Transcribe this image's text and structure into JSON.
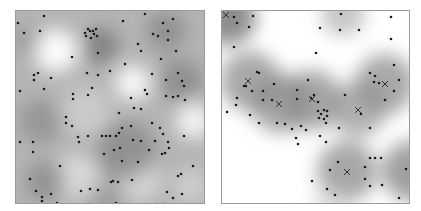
{
  "chart_data": [
    {
      "type": "scatter",
      "title": "",
      "description": "Point pattern over estimated intensity surface (grayscale, darker = higher intensity)",
      "xlabel": "",
      "ylabel": "",
      "grid": false,
      "legend": null,
      "panel": {
        "x": 15,
        "y": 10,
        "width": 188,
        "height": 192
      },
      "background_gray": "#b4b4b4",
      "intensity_blobs": [
        {
          "x": 40,
          "y": 40,
          "r": 22,
          "color": "#ffffff",
          "opacity": 0.95
        },
        {
          "x": 117,
          "y": 72,
          "r": 18,
          "color": "#ffffff",
          "opacity": 0.9
        },
        {
          "x": 178,
          "y": 110,
          "r": 18,
          "color": "#ffffff",
          "opacity": 0.85
        },
        {
          "x": 60,
          "y": 165,
          "r": 22,
          "color": "#e8e8e8",
          "opacity": 0.7
        },
        {
          "x": 125,
          "y": 170,
          "r": 20,
          "color": "#e6e6e6",
          "opacity": 0.7
        },
        {
          "x": 70,
          "y": 100,
          "r": 25,
          "color": "#d8d8d8",
          "opacity": 0.6
        },
        {
          "x": 175,
          "y": 175,
          "r": 18,
          "color": "#dddddd",
          "opacity": 0.6
        },
        {
          "x": 85,
          "y": 35,
          "r": 18,
          "color": "#6e6e6e",
          "opacity": 0.7
        },
        {
          "x": 150,
          "y": 20,
          "r": 20,
          "color": "#7a7a7a",
          "opacity": 0.6
        },
        {
          "x": 165,
          "y": 70,
          "r": 22,
          "color": "#7d7d7d",
          "opacity": 0.65
        },
        {
          "x": 110,
          "y": 140,
          "r": 30,
          "color": "#7a7a7a",
          "opacity": 0.6
        },
        {
          "x": 25,
          "y": 110,
          "r": 22,
          "color": "#808080",
          "opacity": 0.55
        },
        {
          "x": 30,
          "y": 170,
          "r": 20,
          "color": "#7a7a7a",
          "opacity": 0.6
        },
        {
          "x": 10,
          "y": 30,
          "r": 15,
          "color": "#8a8a8a",
          "opacity": 0.5
        },
        {
          "x": 90,
          "y": 190,
          "r": 18,
          "color": "#888888",
          "opacity": 0.5
        }
      ],
      "points": [
        [
          28,
          5
        ],
        [
          2,
          12
        ],
        [
          8,
          22
        ],
        [
          24,
          20
        ],
        [
          69,
          22
        ],
        [
          72,
          18
        ],
        [
          74,
          20
        ],
        [
          77,
          20
        ],
        [
          80,
          18
        ],
        [
          78,
          23
        ],
        [
          75,
          27
        ],
        [
          70,
          25
        ],
        [
          81,
          25
        ],
        [
          107,
          10
        ],
        [
          129,
          3
        ],
        [
          157,
          8
        ],
        [
          147,
          12
        ],
        [
          152,
          20
        ],
        [
          137,
          23
        ],
        [
          142,
          25
        ],
        [
          152,
          29
        ],
        [
          122,
          33
        ],
        [
          125,
          40
        ],
        [
          160,
          40
        ],
        [
          82,
          42
        ],
        [
          56,
          46
        ],
        [
          145,
          48
        ],
        [
          109,
          53
        ],
        [
          162,
          62
        ],
        [
          18,
          64
        ],
        [
          22,
          62
        ],
        [
          18,
          69
        ],
        [
          71,
          62
        ],
        [
          82,
          64
        ],
        [
          94,
          60
        ],
        [
          35,
          67
        ],
        [
          136,
          63
        ],
        [
          166,
          70
        ],
        [
          168,
          75
        ],
        [
          150,
          69
        ],
        [
          4,
          80
        ],
        [
          28,
          78
        ],
        [
          76,
          77
        ],
        [
          57,
          83
        ],
        [
          72,
          84
        ],
        [
          129,
          79
        ],
        [
          131,
          83
        ],
        [
          157,
          86
        ],
        [
          150,
          85
        ],
        [
          162,
          85
        ],
        [
          169,
          89
        ],
        [
          115,
          87
        ],
        [
          57,
          88
        ],
        [
          118,
          97
        ],
        [
          125,
          98
        ],
        [
          103,
          102
        ],
        [
          50,
          106
        ],
        [
          50,
          112
        ],
        [
          56,
          115
        ],
        [
          136,
          112
        ],
        [
          106,
          117
        ],
        [
          115,
          115
        ],
        [
          144,
          117
        ],
        [
          147,
          123
        ],
        [
          168,
          125
        ],
        [
          62,
          126
        ],
        [
          72,
          125
        ],
        [
          86,
          125
        ],
        [
          90,
          125
        ],
        [
          94,
          125
        ],
        [
          100,
          125
        ],
        [
          103,
          122
        ],
        [
          4,
          131
        ],
        [
          17,
          131
        ],
        [
          63,
          131
        ],
        [
          117,
          129
        ],
        [
          125,
          130
        ],
        [
          139,
          130
        ],
        [
          152,
          131
        ],
        [
          17,
          141
        ],
        [
          98,
          139
        ],
        [
          104,
          137
        ],
        [
          133,
          139
        ],
        [
          153,
          137
        ],
        [
          149,
          142
        ],
        [
          146,
          143
        ],
        [
          88,
          143
        ],
        [
          106,
          150
        ],
        [
          122,
          151
        ],
        [
          44,
          155
        ],
        [
          177,
          155
        ],
        [
          162,
          165
        ],
        [
          165,
          163
        ],
        [
          116,
          169
        ],
        [
          102,
          171
        ],
        [
          14,
          168
        ],
        [
          95,
          171
        ],
        [
          97,
          170
        ],
        [
          166,
          183
        ],
        [
          82,
          179
        ],
        [
          74,
          178
        ],
        [
          65,
          180
        ],
        [
          20,
          180
        ],
        [
          26,
          186
        ],
        [
          35,
          183
        ],
        [
          26,
          190
        ],
        [
          41,
          192
        ],
        [
          151,
          181
        ],
        [
          157,
          187
        ],
        [
          147,
          193
        ],
        [
          141,
          193
        ],
        [
          154,
          196
        ],
        [
          167,
          196
        ],
        [
          73,
          193
        ],
        [
          100,
          192
        ]
      ]
    },
    {
      "type": "scatter",
      "title": "",
      "description": "Point pattern over cluster-intensity surface with cluster centres marked X",
      "xlabel": "",
      "ylabel": "",
      "grid": false,
      "legend": null,
      "panel": {
        "x": 221,
        "y": 10,
        "width": 187,
        "height": 192
      },
      "background_gray": "#ffffff",
      "intensity_blobs": [
        {
          "x": 6,
          "y": 6,
          "r": 28,
          "color": "#7a7a7a",
          "opacity": 0.85
        },
        {
          "x": 28,
          "y": 70,
          "r": 30,
          "color": "#8c8c8c",
          "opacity": 0.75
        },
        {
          "x": 59,
          "y": 92,
          "r": 30,
          "color": "#8a8a8a",
          "opacity": 0.75
        },
        {
          "x": 90,
          "y": 89,
          "r": 30,
          "color": "#8a8a8a",
          "opacity": 0.75
        },
        {
          "x": 136,
          "y": 98,
          "r": 28,
          "color": "#909090",
          "opacity": 0.7
        },
        {
          "x": 163,
          "y": 73,
          "r": 30,
          "color": "#8c8c8c",
          "opacity": 0.75
        },
        {
          "x": 125,
          "y": 160,
          "r": 30,
          "color": "#8a8a8a",
          "opacity": 0.75
        },
        {
          "x": 190,
          "y": 160,
          "r": 30,
          "color": "#808080",
          "opacity": 0.75
        },
        {
          "x": 121,
          "y": 3,
          "r": 22,
          "color": "#a0a0a0",
          "opacity": 0.6
        },
        {
          "x": 110,
          "y": 195,
          "r": 20,
          "color": "#c8c8c8",
          "opacity": 0.5
        }
      ],
      "cluster_centres": [
        [
          2,
          2
        ],
        [
          26,
          70
        ],
        [
          57,
          93
        ],
        [
          90,
          88
        ],
        [
          136,
          99
        ],
        [
          163,
          73
        ],
        [
          125,
          161
        ]
      ],
      "points": [
        [
          12,
          6
        ],
        [
          31,
          5
        ],
        [
          15,
          12
        ],
        [
          27,
          16
        ],
        [
          12,
          36
        ],
        [
          98,
          17
        ],
        [
          119,
          3
        ],
        [
          118,
          19
        ],
        [
          137,
          19
        ],
        [
          169,
          6
        ],
        [
          169,
          28
        ],
        [
          94,
          42
        ],
        [
          35,
          61
        ],
        [
          37,
          62
        ],
        [
          22,
          75
        ],
        [
          24,
          75
        ],
        [
          30,
          80
        ],
        [
          41,
          80
        ],
        [
          52,
          73
        ],
        [
          50,
          89
        ],
        [
          41,
          89
        ],
        [
          15,
          87
        ],
        [
          86,
          69
        ],
        [
          75,
          79
        ],
        [
          75,
          88
        ],
        [
          89,
          87
        ],
        [
          92,
          84
        ],
        [
          96,
          91
        ],
        [
          96,
          100
        ],
        [
          99,
          103
        ],
        [
          102,
          99
        ],
        [
          105,
          100
        ],
        [
          105,
          105
        ],
        [
          102,
          108
        ],
        [
          104,
          112
        ],
        [
          97,
          107
        ],
        [
          123,
          84
        ],
        [
          148,
          62
        ],
        [
          153,
          65
        ],
        [
          152,
          71
        ],
        [
          157,
          72
        ],
        [
          172,
          54
        ],
        [
          172,
          80
        ],
        [
          177,
          69
        ],
        [
          163,
          89
        ],
        [
          139,
          103
        ],
        [
          117,
          117
        ],
        [
          148,
          117
        ],
        [
          5,
          101
        ],
        [
          14,
          94
        ],
        [
          28,
          104
        ],
        [
          37,
          112
        ],
        [
          55,
          112
        ],
        [
          63,
          113
        ],
        [
          70,
          118
        ],
        [
          79,
          115
        ],
        [
          84,
          119
        ],
        [
          74,
          127
        ],
        [
          76,
          133
        ],
        [
          98,
          125
        ],
        [
          104,
          131
        ],
        [
          148,
          147
        ],
        [
          153,
          147
        ],
        [
          159,
          147
        ],
        [
          148,
          175
        ],
        [
          116,
          151
        ],
        [
          108,
          159
        ],
        [
          143,
          156
        ],
        [
          143,
          168
        ],
        [
          90,
          170
        ],
        [
          113,
          184
        ],
        [
          105,
          178
        ],
        [
          160,
          174
        ],
        [
          184,
          158
        ],
        [
          177,
          187
        ]
      ]
    }
  ],
  "figure": {
    "left_panel_label": "",
    "right_panel_label": "",
    "point_color": "#1a1a1a",
    "cross_color": "#333333",
    "border_color": "#9a9a9a"
  }
}
